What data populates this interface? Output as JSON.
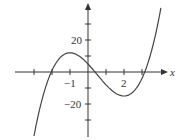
{
  "chart_data": {
    "type": "line",
    "title": "",
    "function": "f(x) = 2x^3 - 3x^2 - 12x + 5",
    "xlabel": "x",
    "ylabel": "",
    "xlim": [
      -4,
      4.3
    ],
    "ylim": [
      -42,
      43
    ],
    "x_tick_labels": [
      "-1",
      "2"
    ],
    "y_tick_labels": [
      "20",
      "-20"
    ],
    "x_ticks": [
      -4,
      -3,
      -2,
      -1,
      1,
      2,
      3
    ],
    "y_ticks": [
      -30,
      -20,
      -10,
      10,
      20,
      30
    ],
    "grid": false,
    "series": [
      {
        "name": "f(x)",
        "x": [
          -3,
          -2.5,
          -2,
          -1.5,
          -1,
          -0.5,
          0,
          0.5,
          1,
          1.5,
          2,
          2.5,
          3,
          3.5,
          4
        ],
        "y": [
          -40,
          -15,
          1,
          9.5,
          12,
          10.5,
          5,
          -1.5,
          -8,
          -13,
          -15,
          -12.5,
          -4,
          12,
          37
        ]
      }
    ],
    "key_points": {
      "local_max": [
        -1,
        12
      ],
      "local_min": [
        2,
        -15
      ],
      "y_intercept": [
        0,
        5
      ]
    }
  },
  "labels": {
    "x_axis": "x",
    "x_neg1": "−1",
    "x_2": "2",
    "y_20": "20",
    "y_neg20": "−20"
  }
}
